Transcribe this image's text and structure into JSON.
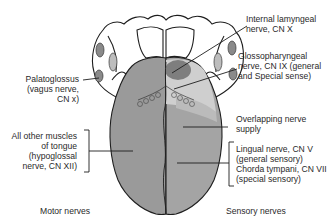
{
  "diagram": {
    "colors": {
      "motor_region": "#9a9a9a",
      "sensory_anterior": "#a4a4a4",
      "glossopharyngeal_region": "#cfcfcf",
      "internal_laryngeal_region": "#7e7e7e",
      "outline": "#1e1e1e",
      "background": "#ffffff"
    }
  },
  "labels": {
    "palatoglossus": [
      "Palatoglossus",
      "(vagus nerve,",
      "CN x)"
    ],
    "other_muscles": [
      "All other muscles",
      "of tongue",
      "(hypoglossal",
      "nerve, CN XII)"
    ],
    "internal_laryngeal": [
      "Internal lamyngeal",
      "nerve, CN X"
    ],
    "glossopharyngeal": [
      "Glossopharyngeal",
      "nerve, CN IX (general",
      "and Special sense)"
    ],
    "overlapping": [
      "Overlapping nerve",
      "supply"
    ],
    "lingual_chorda": [
      "Lingual nerve, CN V",
      "(general sensory)",
      "Chorda tympani, CN VII",
      "(special sensory)"
    ]
  },
  "headings": {
    "motor": "Motor nerves",
    "sensory": "Sensory nerves"
  }
}
